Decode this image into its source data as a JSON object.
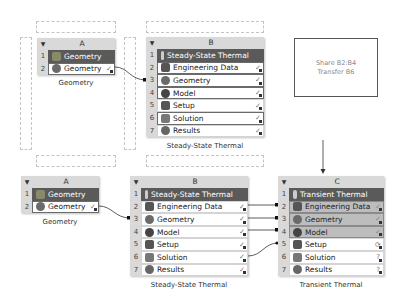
{
  "top": {
    "systemA": {
      "column": "A",
      "rows": [
        {
          "num": "1",
          "label": "Geometry",
          "icon": "geometry-system-icon",
          "status": ""
        },
        {
          "num": "2",
          "label": "Geometry",
          "icon": "geometry-cell-icon",
          "status": "✓"
        }
      ],
      "caption": "Geometry"
    },
    "systemB": {
      "column": "B",
      "rows": [
        {
          "num": "1",
          "label": "Steady-State Thermal",
          "icon": "thermal-icon",
          "status": ""
        },
        {
          "num": "2",
          "label": "Engineering Data",
          "icon": "engineering-data-icon",
          "status": "✓"
        },
        {
          "num": "3",
          "label": "Geometry",
          "icon": "geometry-cell-icon",
          "status": "✓"
        },
        {
          "num": "4",
          "label": "Model",
          "icon": "model-icon",
          "status": "✓"
        },
        {
          "num": "5",
          "label": "Setup",
          "icon": "setup-icon",
          "status": "✓"
        },
        {
          "num": "6",
          "label": "Solution",
          "icon": "solution-icon",
          "status": "✓"
        },
        {
          "num": "7",
          "label": "Results",
          "icon": "results-icon",
          "status": "✓"
        }
      ],
      "caption": "Steady-State Thermal"
    }
  },
  "note": {
    "line1": "Share B2:B4",
    "line2": "Transfer B6"
  },
  "bottom": {
    "systemA": {
      "column": "A",
      "rows": [
        {
          "num": "1",
          "label": "Geometry",
          "status": ""
        },
        {
          "num": "2",
          "label": "Geometry",
          "status": "✓"
        }
      ],
      "caption": "Geometry"
    },
    "systemB": {
      "column": "B",
      "rows": [
        {
          "num": "1",
          "label": "Steady-State Thermal",
          "status": ""
        },
        {
          "num": "2",
          "label": "Engineering Data",
          "status": "✓"
        },
        {
          "num": "3",
          "label": "Geometry",
          "status": "✓"
        },
        {
          "num": "4",
          "label": "Model",
          "status": "✓"
        },
        {
          "num": "5",
          "label": "Setup",
          "status": "✓"
        },
        {
          "num": "6",
          "label": "Solution",
          "status": "✓"
        },
        {
          "num": "7",
          "label": "Results",
          "status": "✓"
        }
      ],
      "caption": "Steady-State Thermal"
    },
    "systemC": {
      "column": "C",
      "rows": [
        {
          "num": "1",
          "label": "Transient Thermal",
          "status": ""
        },
        {
          "num": "2",
          "label": "Engineering Data",
          "status": "✓"
        },
        {
          "num": "3",
          "label": "Geometry",
          "status": "✓"
        },
        {
          "num": "4",
          "label": "Model",
          "status": "✓"
        },
        {
          "num": "5",
          "label": "Setup",
          "status": "⟳"
        },
        {
          "num": "6",
          "label": "Solution",
          "status": "?"
        },
        {
          "num": "7",
          "label": "Results",
          "status": "?"
        }
      ],
      "caption": "Transient Thermal"
    }
  },
  "colors": {
    "title_bg": "#5a5a5a",
    "header_bg": "#d9d9d9",
    "shared_bg": "#bdbdbd",
    "border": "#6a6a6a"
  }
}
